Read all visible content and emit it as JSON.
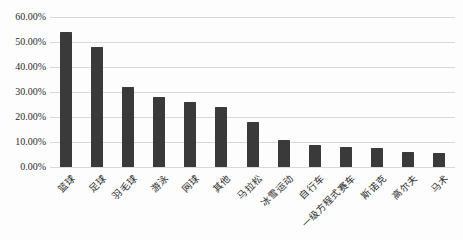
{
  "figure": {
    "background": "#fdfdfd",
    "bar_color": "#3a3a3a",
    "gridline_color": "#d9d9d9",
    "text_color": "#2b2b2b"
  },
  "chart_data": {
    "type": "bar",
    "title": "",
    "xlabel": "",
    "ylabel": "",
    "categories": [
      "篮球",
      "足球",
      "羽毛球",
      "游泳",
      "网球",
      "其他",
      "马拉松",
      "冰雪运动",
      "自行车",
      "一级方程式赛车",
      "斯诺克",
      "高尔夫",
      "马术"
    ],
    "values": [
      54,
      48,
      32,
      28,
      26,
      24,
      18,
      11,
      9,
      8,
      7.5,
      6,
      5.5
    ],
    "value_unit": "%",
    "ylim": [
      0,
      60
    ],
    "ytick_step": 10,
    "ytick_labels": [
      "0.00%",
      "10.00%",
      "20.00%",
      "30.00%",
      "40.00%",
      "50.00%",
      "60.00%"
    ],
    "grid": true,
    "legend": false,
    "x_label_rotation_deg": 45
  }
}
